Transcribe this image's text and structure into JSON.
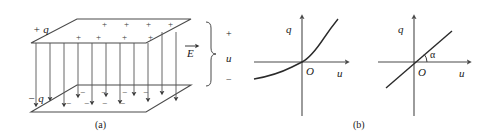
{
  "figure": {
    "title_hidden": "",
    "background_color": "#ffffff",
    "ink_color": "#2a2a2a"
  },
  "panel_a": {
    "caption": "(a)",
    "charge_top_label": "+ q",
    "charge_bottom_label": "− q",
    "field_label": "E",
    "voltage_label": "u",
    "terminal_positive": "+",
    "terminal_negative": "−",
    "plus_sign": "+",
    "minus_sign": "−",
    "top_plate_signs_back": [
      "+",
      "+",
      "+",
      "+"
    ],
    "top_plate_signs_front": [
      "+",
      "+",
      "+",
      "+"
    ],
    "bottom_plate_signs_back": [
      "−",
      "−",
      "−",
      "−"
    ],
    "bottom_plate_signs_front": [
      "−",
      "−",
      "−",
      "−"
    ],
    "field_arrow_count": 9,
    "description": "parallel-plate capacitor with uniform downward electric field"
  },
  "panel_b": {
    "caption": "(b)",
    "charts": [
      {
        "id": "nonlinear",
        "type": "line",
        "title": "",
        "xlabel": "u",
        "ylabel": "q",
        "origin_label": "O",
        "xlim": [
          -1,
          1
        ],
        "ylim": [
          -1,
          1
        ],
        "grid": false,
        "legend": "none",
        "series": [
          {
            "name": "q(u) nonlinear",
            "x": [
              -1.0,
              -0.85,
              -0.7,
              -0.55,
              -0.4,
              -0.25,
              -0.1,
              0.0,
              0.1,
              0.25,
              0.4,
              0.55,
              0.7,
              0.85,
              1.0
            ],
            "y": [
              -0.52,
              -0.46,
              -0.4,
              -0.33,
              -0.25,
              -0.15,
              -0.06,
              0.0,
              0.07,
              0.2,
              0.35,
              0.53,
              0.73,
              0.93,
              1.12
            ]
          }
        ],
        "annotations": []
      },
      {
        "id": "linear",
        "type": "line",
        "title": "",
        "xlabel": "u",
        "ylabel": "q",
        "origin_label": "O",
        "xlim": [
          -1,
          1
        ],
        "ylim": [
          -1,
          1
        ],
        "grid": false,
        "legend": "none",
        "series": [
          {
            "name": "q = Cu linear",
            "x": [
              -0.78,
              0.0,
              0.82
            ],
            "y": [
              -0.62,
              0.0,
              0.66
            ]
          }
        ],
        "annotations": [
          {
            "text": "α",
            "meaning": "slope angle between line and u axis"
          }
        ]
      }
    ]
  }
}
